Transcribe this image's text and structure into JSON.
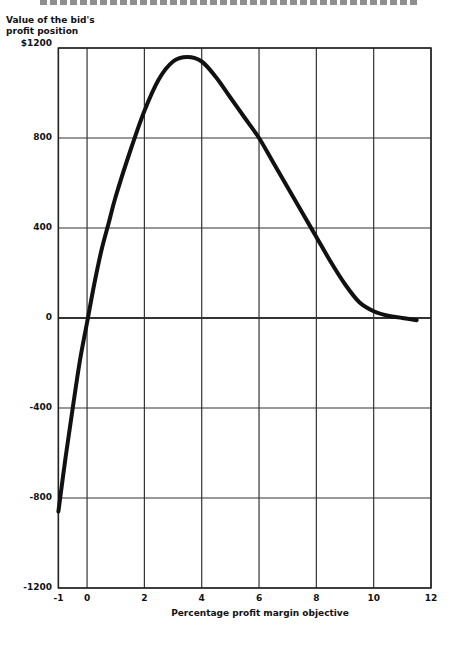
{
  "chart_data": {
    "type": "line",
    "title": "",
    "ylabel": "Value of the bid's profit position",
    "xlabel": "Percentage profit margin objective",
    "xlim": [
      -1,
      12
    ],
    "ylim": [
      -1200,
      1200
    ],
    "grid": true,
    "x_ticks": [
      "-1",
      "0",
      "2",
      "4",
      "6",
      "8",
      "10",
      "12"
    ],
    "y_ticks": [
      "$1200",
      "800",
      "400",
      "0",
      "-400",
      "-800",
      "-1200"
    ],
    "series": [
      {
        "name": "Value of the bid's profit position",
        "x": [
          -1,
          -0.75,
          -0.5,
          -0.25,
          0,
          0.25,
          0.5,
          0.75,
          1,
          1.5,
          2,
          2.5,
          3,
          3.5,
          4,
          4.5,
          5,
          5.5,
          6,
          6.5,
          7,
          7.5,
          8,
          8.5,
          9,
          9.5,
          10,
          10.5,
          11,
          11.5
        ],
        "values": [
          -860,
          -620,
          -400,
          -190,
          -20,
          150,
          300,
          420,
          540,
          740,
          920,
          1060,
          1140,
          1160,
          1140,
          1070,
          980,
          890,
          800,
          690,
          580,
          470,
          360,
          250,
          150,
          70,
          30,
          10,
          0,
          -10
        ]
      }
    ]
  },
  "labels": {
    "ylabel_line1": "Value of the bid's",
    "ylabel_line2": "profit position",
    "xlabel": "Percentage profit margin objective"
  }
}
